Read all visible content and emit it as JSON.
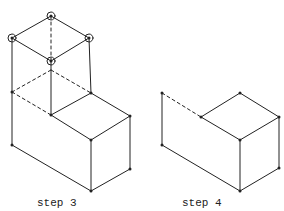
{
  "figure": {
    "panels": [
      {
        "id": "step3",
        "caption": "step 3"
      },
      {
        "id": "step4",
        "caption": "step 4"
      }
    ],
    "colors": {
      "line": "#222222",
      "background": "#ffffff"
    }
  }
}
